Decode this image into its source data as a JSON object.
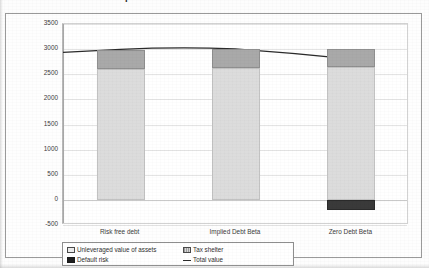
{
  "document": {
    "title_clipped": "Exhibit 11.2   Value of the Op"
  },
  "chart_data": {
    "type": "bar",
    "stacked": true,
    "title": "",
    "xlabel": "",
    "ylabel": "",
    "ylim": [
      -500,
      3500
    ],
    "ytick_step": 500,
    "ytick_labels": [
      "3500",
      "3000",
      "2500",
      "2000",
      "1500",
      "1000",
      "500",
      "0",
      "-500"
    ],
    "ytick_values": [
      3500,
      3000,
      2500,
      2000,
      1500,
      1000,
      500,
      0,
      -500
    ],
    "grid": true,
    "legend_position": "bottom-left",
    "categories": [
      "Risk free debt",
      "Implied Debt Beta",
      "Zero Debt Beta"
    ],
    "series": [
      {
        "name": "Unleveraged value of assets",
        "color": "#dcdcdc",
        "values": [
          2600,
          2620,
          2650
        ]
      },
      {
        "name": "Tax shelter",
        "color": "#a9a9a9",
        "values": [
          390,
          380,
          350
        ]
      },
      {
        "name": "Default risk",
        "color": "#3a3a3a",
        "values": [
          0,
          0,
          -200
        ]
      },
      {
        "name": "Total value",
        "type": "line",
        "color": "#2b2b2b",
        "values": [
          2990,
          3000,
          2800
        ]
      }
    ]
  },
  "legend": {
    "entries": [
      {
        "label": "Unleveraged value of assets",
        "marker": "swatch-assets"
      },
      {
        "label": "Tax shelter",
        "marker": "swatch-shelter"
      },
      {
        "label": "Default risk",
        "marker": "swatch-default"
      },
      {
        "label": "Total value",
        "marker": "swatch-line"
      }
    ]
  }
}
